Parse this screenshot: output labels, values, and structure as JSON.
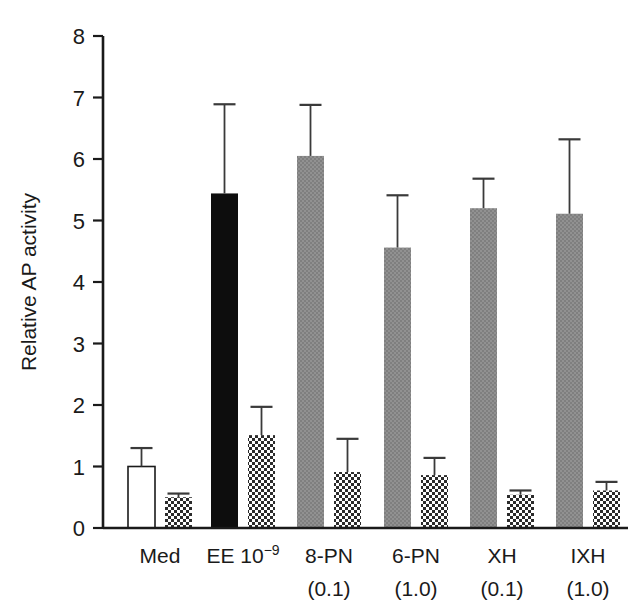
{
  "chart_data": {
    "type": "bar",
    "title": "",
    "xlabel": "",
    "ylabel": "Relative AP activity",
    "ylim": [
      0,
      8
    ],
    "yticks": [
      0,
      1,
      2,
      3,
      4,
      5,
      6,
      7,
      8
    ],
    "ytick_labels": [
      "0",
      "1",
      "2",
      "3",
      "4",
      "5",
      "6",
      "7",
      "8"
    ],
    "grid": false,
    "legend": "none",
    "categories": [
      {
        "line1": "Med",
        "line2": "",
        "sup": ""
      },
      {
        "line1": "EE 10",
        "line2": "",
        "sup": "−9"
      },
      {
        "line1": "8-PN",
        "line2": "(0.1)",
        "sup": ""
      },
      {
        "line1": "6-PN",
        "line2": "(1.0)",
        "sup": ""
      },
      {
        "line1": "XH",
        "line2": "(0.1)",
        "sup": ""
      },
      {
        "line1": "IXH",
        "line2": "(1.0)",
        "sup": ""
      }
    ],
    "series": [
      {
        "name": "Series 1 (solid bars)",
        "fills": [
          "open",
          "black",
          "gray",
          "gray",
          "gray",
          "gray"
        ],
        "values": [
          1.0,
          5.44,
          6.05,
          4.56,
          5.2,
          5.11
        ],
        "errors": [
          0.3,
          1.45,
          0.83,
          0.85,
          0.48,
          1.21
        ]
      },
      {
        "name": "Series 2 (checkered bars)",
        "fills": [
          "checker",
          "checker",
          "checker",
          "checker",
          "checker",
          "checker"
        ],
        "values": [
          0.5,
          1.51,
          0.91,
          0.86,
          0.54,
          0.61
        ],
        "errors": [
          0.06,
          0.46,
          0.54,
          0.28,
          0.07,
          0.14
        ]
      }
    ],
    "colors": {
      "open": "#ffffff",
      "black": "#0d0d0d",
      "gray": "#8c8c8c",
      "checker_dark": "#2b2b2b",
      "checker_light": "#ffffff",
      "axis": "#1a1a1a",
      "error_bar": "#3a3a3a",
      "background": "#ffffff"
    }
  },
  "geometry": {
    "plot_left": 103,
    "plot_right": 628,
    "plot_top": 36,
    "plot_bottom": 528,
    "bar_width": 27,
    "group_centers": [
      160,
      243,
      329,
      416,
      502,
      588
    ],
    "pair_offset": 23
  }
}
